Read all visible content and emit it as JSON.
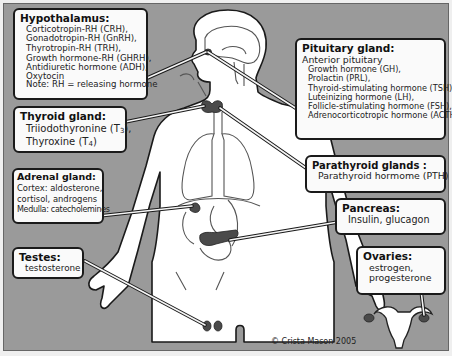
{
  "figure": {
    "type": "human endocrine system diagram",
    "background_color": "#9a9a9a",
    "label_box_color": "#fafafa",
    "label_border_color": "#1a1a1a"
  },
  "labels": {
    "hypothalamus": {
      "title": "Hypothalamus:",
      "lines": [
        "Corticotropin-RH (CRH),",
        "Gonadotropin-RH (GnRH),",
        "Thyrotropin-RH (TRH),",
        "Growth hormone-RH (GHRH),",
        "Antidiuretic hormone (ADH),",
        "Oxytocin",
        "Note: RH = releasing hormone"
      ]
    },
    "thyroid": {
      "title": "Thyroid gland:",
      "lines": [
        "Triiodothyronine (T3),",
        "Thyroxine (T4)"
      ],
      "line_parts": [
        {
          "text": "Triiodothyronine (T",
          "sub": "3",
          "after": "),"
        },
        {
          "text": "Thyroxine (T",
          "sub": "4",
          "after": ")"
        }
      ]
    },
    "adrenal": {
      "title": "Adrenal gland:",
      "lines": [
        "Cortex: aldosterone,",
        "cortisol, androgens",
        "Medulla: catecholemines"
      ]
    },
    "testes": {
      "title": "Testes:",
      "lines": [
        "testosterone"
      ]
    },
    "pituitary": {
      "title": "Pituitary gland:",
      "subtitle": "Anterior pituitary",
      "lines": [
        "Growth hormone (GH),",
        "Prolactin (PRL),",
        "Thyroid-stimulating hormone (TSH),",
        "Luteinizing hormone (LH),",
        "Follicle-stimulating hormone (FSH),",
        "Adrenocorticotropic hormone (ACTH)"
      ]
    },
    "parathyroid": {
      "title": "Parathyroid glands :",
      "lines": [
        "Parathyroid hormome (PTH)"
      ]
    },
    "pancreas": {
      "title": "Pancreas:",
      "lines": [
        "Insulin, glucagon"
      ]
    },
    "ovaries": {
      "title": "Ovaries:",
      "lines": [
        "estrogen,",
        "progesterone"
      ]
    }
  },
  "credit": "© Crista Mason 2005"
}
